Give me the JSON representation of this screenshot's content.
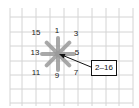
{
  "diagram": {
    "grid": {
      "x_lines": [
        10,
        22,
        36,
        50,
        64,
        78,
        92,
        106,
        119,
        133
      ],
      "y_lines": [
        17,
        32,
        46,
        61,
        75,
        89,
        103
      ],
      "color": "#d4d4d4"
    },
    "star": {
      "center": [
        58,
        54
      ],
      "arm_length": 16,
      "arm_color": "#9a9a9a",
      "arm_width": 4,
      "labels": [
        {
          "text": "1",
          "x": 57,
          "y": 31
        },
        {
          "text": "3",
          "x": 76,
          "y": 34
        },
        {
          "text": "5",
          "x": 77,
          "y": 53
        },
        {
          "text": "7",
          "x": 76,
          "y": 73
        },
        {
          "text": "9",
          "x": 57,
          "y": 76
        },
        {
          "text": "11",
          "x": 36,
          "y": 73
        },
        {
          "text": "13",
          "x": 35,
          "y": 53
        },
        {
          "text": "15",
          "x": 36,
          "y": 33
        }
      ]
    },
    "callout": {
      "label": "2–16",
      "arrow_from": [
        91,
        67
      ],
      "arrow_to": [
        59,
        54
      ],
      "arrow_color": "#111111"
    }
  }
}
